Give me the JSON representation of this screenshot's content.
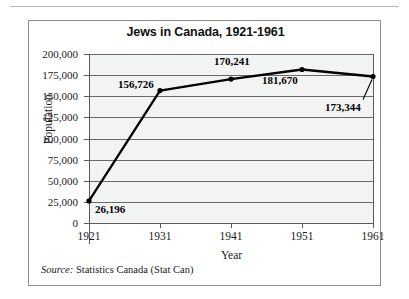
{
  "figure": {
    "source_label": "Source:",
    "source_text": " Statistics Canada (Stat Can)"
  },
  "chart_data": {
    "type": "line",
    "title": "Jews in Canada, 1921-1961",
    "xlabel": "Year",
    "ylabel": "Population",
    "categories": [
      "1921",
      "1931",
      "1941",
      "1951",
      "1961"
    ],
    "x": [
      1921,
      1931,
      1941,
      1951,
      1961
    ],
    "values": [
      26196,
      156726,
      170241,
      181670,
      173344
    ],
    "point_labels": [
      "26,196",
      "156,726",
      "170,241",
      "181,670",
      "173,344"
    ],
    "series": [
      {
        "name": "Population",
        "values": [
          26196,
          156726,
          170241,
          181670,
          173344
        ]
      }
    ],
    "ylim": [
      0,
      200000
    ],
    "ytick_values": [
      0,
      25000,
      50000,
      75000,
      100000,
      125000,
      150000,
      175000,
      200000
    ],
    "yticks": [
      "0",
      "25,000",
      "50,000",
      "75,000",
      "100,000",
      "125,000",
      "150,000",
      "175,000",
      "200,000"
    ],
    "xticks": [
      "1921",
      "1931",
      "1941",
      "1951",
      "1961"
    ],
    "grid": true,
    "legend": false,
    "marker": "circle",
    "line_color": "#000000",
    "plot_background": "#f2f4f4",
    "gridline_color": "#6b6b6b"
  }
}
